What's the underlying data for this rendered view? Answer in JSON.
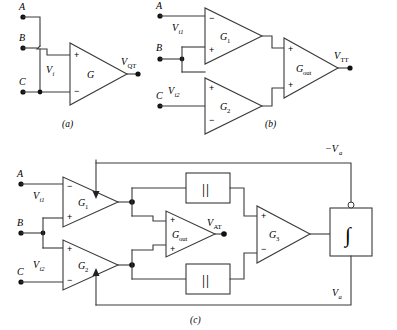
{
  "figure": {
    "background_color": "#ffffff",
    "line_color": "#3a3a3a",
    "node_color": "#111111",
    "text_color": "#000000"
  },
  "panels": [
    {
      "id": "a",
      "caption": "(a)",
      "terminals": [
        {
          "name": "A",
          "label": "A"
        },
        {
          "name": "B",
          "label": "B"
        },
        {
          "name": "C",
          "label": "C"
        }
      ],
      "signals": [
        {
          "name": "input-voltage",
          "base": "V",
          "sub": "i"
        }
      ],
      "amplifiers": [
        {
          "name": "G",
          "label": "G",
          "sub": "",
          "input_top": "+",
          "input_bottom": "−"
        }
      ],
      "outputs": [
        {
          "name": "output-voltage",
          "base": "V",
          "sub": "QT"
        }
      ]
    },
    {
      "id": "b",
      "caption": "(b)",
      "terminals": [
        {
          "name": "A",
          "label": "A"
        },
        {
          "name": "B",
          "label": "B"
        },
        {
          "name": "C",
          "label": "C"
        }
      ],
      "signals": [
        {
          "name": "input-voltage-1",
          "base": "V",
          "sub": "i1"
        },
        {
          "name": "input-voltage-2",
          "base": "V",
          "sub": "i2"
        }
      ],
      "amplifiers": [
        {
          "name": "G1",
          "label": "G",
          "sub": "1",
          "input_top": "−",
          "input_bottom": "+"
        },
        {
          "name": "G2",
          "label": "G",
          "sub": "2",
          "input_top": "+",
          "input_bottom": "−"
        },
        {
          "name": "Gout",
          "label": "G",
          "sub": "out",
          "input_top": "+",
          "input_bottom": "+"
        }
      ],
      "outputs": [
        {
          "name": "output-voltage",
          "base": "V",
          "sub": "TT"
        }
      ]
    },
    {
      "id": "c",
      "caption": "(c)",
      "terminals": [
        {
          "name": "A",
          "label": "A"
        },
        {
          "name": "B",
          "label": "B"
        },
        {
          "name": "C",
          "label": "C"
        }
      ],
      "signals": [
        {
          "name": "input-voltage-1",
          "base": "V",
          "sub": "i1"
        },
        {
          "name": "input-voltage-2",
          "base": "V",
          "sub": "i2"
        }
      ],
      "amplifiers": [
        {
          "name": "G1",
          "label": "G",
          "sub": "1",
          "input_top": "−",
          "input_bottom": "+"
        },
        {
          "name": "G2",
          "label": "G",
          "sub": "2",
          "input_top": "+",
          "input_bottom": "−"
        },
        {
          "name": "Gout",
          "label": "G",
          "sub": "out",
          "input_top": "+",
          "input_bottom": "+"
        },
        {
          "name": "G3",
          "label": "G",
          "sub": "3",
          "input_top": "+",
          "input_bottom": "−"
        }
      ],
      "blocks": [
        {
          "name": "abs-value-top",
          "label": "||",
          "kind": "absolute-value"
        },
        {
          "name": "abs-value-bottom",
          "label": "||",
          "kind": "absolute-value"
        },
        {
          "name": "integrator",
          "label": "∫",
          "kind": "integrator",
          "inverting_bubble": true
        }
      ],
      "outputs": [
        {
          "name": "at-voltage",
          "base": "V",
          "sub": "AT"
        }
      ],
      "feedback": [
        {
          "name": "feedback-negative",
          "base": "−V",
          "sub": "a"
        },
        {
          "name": "feedback-positive",
          "base": "V",
          "sub": "a"
        }
      ]
    }
  ]
}
